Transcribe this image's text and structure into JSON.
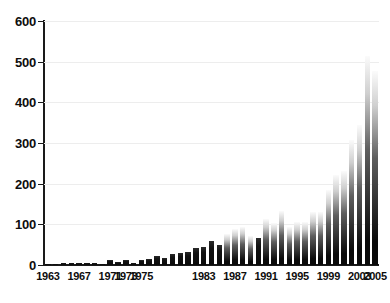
{
  "chart_data": {
    "type": "bar",
    "title": "",
    "subtitle": "",
    "xlabel": "",
    "ylabel": "",
    "xlim": [
      1962.5,
      2005.5
    ],
    "ylim": [
      0,
      600
    ],
    "grid": true,
    "legend": null,
    "y_ticks": [
      0,
      100,
      200,
      300,
      400,
      500,
      600
    ],
    "y_tick_labels": [
      "0",
      "100",
      "200",
      "300",
      "400",
      "500",
      "600"
    ],
    "x_tick_labels": [
      "1963",
      "1967",
      "1971",
      "1973",
      "1975",
      "1983",
      "1987",
      "1991",
      "1995",
      "1999",
      "2003",
      "2005"
    ],
    "categories": [
      "1963",
      "1964",
      "1965",
      "1966",
      "1967",
      "1968",
      "1969",
      "1970",
      "1971",
      "1972",
      "1973",
      "1974",
      "1975",
      "1976",
      "1977",
      "1978",
      "1979",
      "1980",
      "1981",
      "1982",
      "1983",
      "1984",
      "1985",
      "1986",
      "1987",
      "1988",
      "1989",
      "1990",
      "1991",
      "1992",
      "1993",
      "1994",
      "1995",
      "1996",
      "1997",
      "1998",
      "1999",
      "2000",
      "2001",
      "2002",
      "2003",
      "2004",
      "2005"
    ],
    "values": [
      1,
      2,
      4,
      5,
      5,
      4,
      4,
      3,
      12,
      8,
      12,
      5,
      12,
      14,
      23,
      17,
      27,
      29,
      32,
      41,
      44,
      60,
      48,
      76,
      88,
      94,
      71,
      66,
      112,
      103,
      133,
      94,
      107,
      105,
      131,
      131,
      184,
      221,
      232,
      308,
      345,
      515,
      476
    ],
    "colors": {
      "bar_top": "#fbfbfb",
      "bar_bottom": "#0a0a0a",
      "axis": "#1a1a1a",
      "grid": "#ededed",
      "background": "#ffffff",
      "text": "#0d0d0d"
    }
  }
}
